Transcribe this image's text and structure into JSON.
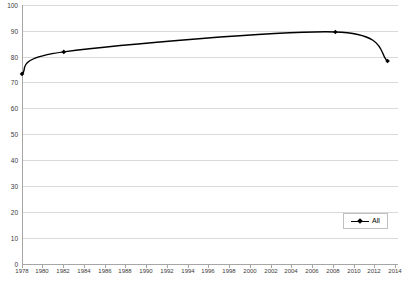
{
  "chart_data": {
    "type": "line",
    "title": "",
    "subtitle": "",
    "xlabel": "",
    "ylabel": "",
    "xlim": [
      1978,
      2014
    ],
    "ylim": [
      0,
      100
    ],
    "grid": true,
    "legend_position": "bottom-right",
    "x_ticks": [
      "1978",
      "1980",
      "1982",
      "1984",
      "1986",
      "1988",
      "1990",
      "1992",
      "1994",
      "1996",
      "1998",
      "2000",
      "2002",
      "2004",
      "2006",
      "2008",
      "2010",
      "2012",
      "2014"
    ],
    "y_ticks": [
      "0",
      "10",
      "20",
      "30",
      "40",
      "50",
      "60",
      "70",
      "80",
      "90",
      "100"
    ],
    "series": [
      {
        "name": "All",
        "color": "#000000",
        "marker": "diamond",
        "x": [
          1978,
          1982,
          2008,
          2013
        ],
        "values": [
          73.4,
          81.9,
          89.6,
          78.4
        ]
      }
    ]
  },
  "legend": {
    "entries": [
      {
        "label": "All"
      }
    ]
  }
}
